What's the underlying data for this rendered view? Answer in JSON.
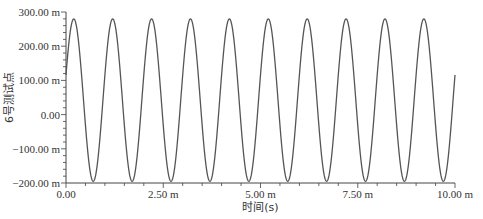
{
  "chart_data": {
    "type": "line",
    "title": "",
    "xlabel": "时间(s)",
    "ylabel": "6号测试点",
    "xlim": [
      0,
      10
    ],
    "ylim": [
      -200,
      300
    ],
    "x_ticks": [
      {
        "value": 0,
        "label": "0.00"
      },
      {
        "value": 2.5,
        "label": "2.50 m"
      },
      {
        "value": 5,
        "label": "5.00 m"
      },
      {
        "value": 7.5,
        "label": "7.50 m"
      },
      {
        "value": 10,
        "label": "10.00 m"
      }
    ],
    "y_ticks": [
      {
        "value": 300,
        "label": "300.00 m"
      },
      {
        "value": 200,
        "label": "200.00 m"
      },
      {
        "value": 100,
        "label": "100.00 m"
      },
      {
        "value": 0,
        "label": "0.00"
      },
      {
        "value": -100,
        "label": "-100.00 m"
      },
      {
        "value": -200,
        "label": "-200.00 m"
      }
    ],
    "grid": false,
    "legend": null,
    "series": [
      {
        "name": "6号测试点",
        "color": "#555555",
        "model": {
          "offset": 42.5,
          "amplitude": 237.5,
          "period": 1.0,
          "peak_at": 0.2
        },
        "peaks_x": [
          0.2,
          1.2,
          2.2,
          3.2,
          4.2,
          5.2,
          6.2,
          7.2,
          8.2,
          9.2
        ],
        "peak_value": 280,
        "troughs_x": [
          0.7,
          1.7,
          2.7,
          3.7,
          4.7,
          5.7,
          6.7,
          7.7,
          8.7,
          9.7
        ],
        "trough_value": -195,
        "start_value": 116,
        "end_value": 116
      }
    ]
  },
  "layout": {
    "plot": {
      "left": 66,
      "right": 455,
      "top": 12,
      "bottom": 183
    }
  }
}
